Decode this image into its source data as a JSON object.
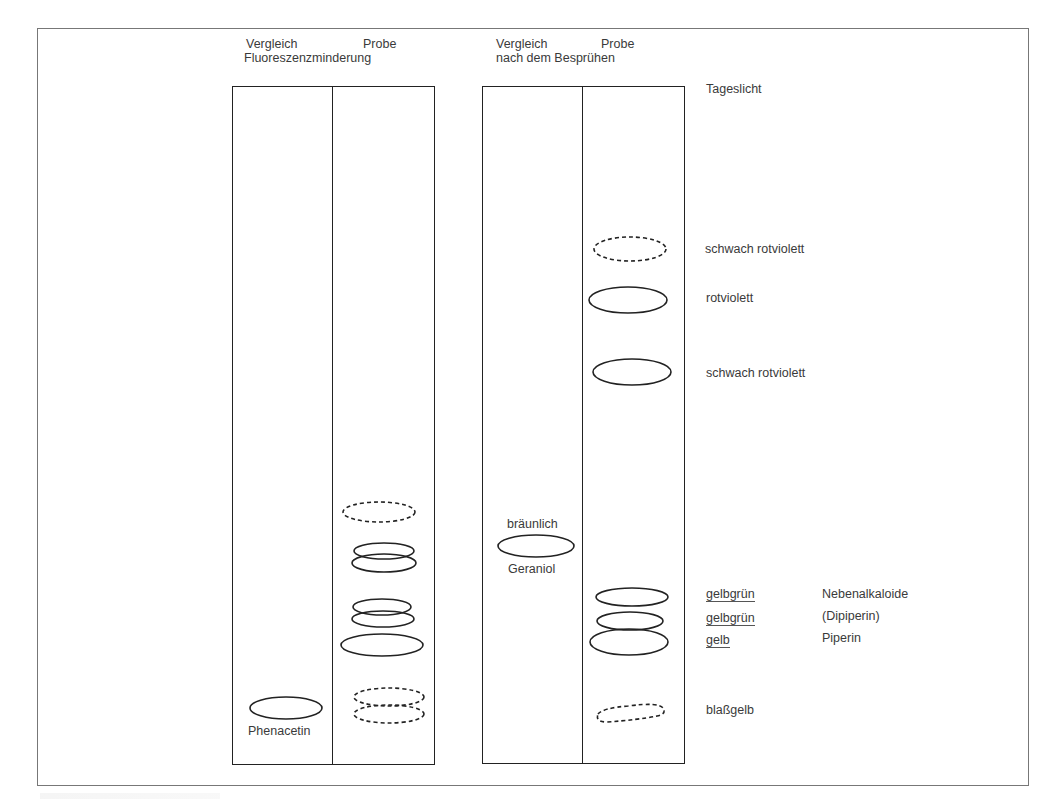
{
  "figure": {
    "plate_left": {
      "header_line1_left": "Vergleich",
      "header_line1_right": "Probe",
      "header_line2": "Fluoreszenzminderung",
      "reference_label": "Phenacetin"
    },
    "plate_right": {
      "header_line1_left": "Vergleich",
      "header_line1_right": "Probe",
      "header_line2": "nach dem Besprühen",
      "reference_color": "bräunlich",
      "reference_label": "Geraniol"
    },
    "right_annotations": {
      "light": "Tageslicht",
      "spots": [
        {
          "color": "schwach rotviolett",
          "compound": ""
        },
        {
          "color": "rotviolett",
          "compound": ""
        },
        {
          "color": "schwach rotviolett",
          "compound": ""
        },
        {
          "color": "gelbgrün",
          "compound": "Nebenalkaloide"
        },
        {
          "color": "gelbgrün",
          "compound": "(Dipiperin)"
        },
        {
          "color": "gelb",
          "compound": "Piperin"
        },
        {
          "color": "blaßgelb",
          "compound": ""
        }
      ]
    }
  }
}
